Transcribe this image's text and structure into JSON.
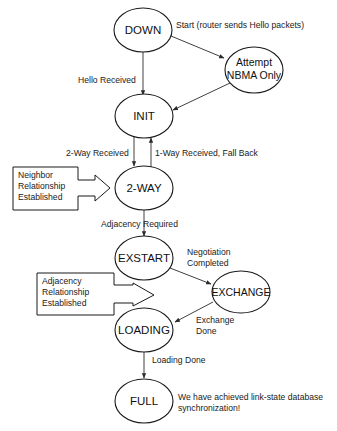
{
  "diagram": {
    "type": "state-machine",
    "topic": "OSPF neighbor states",
    "states": {
      "down": "DOWN",
      "attempt": [
        "Attempt",
        "NBMA Only"
      ],
      "init": "INIT",
      "twoway": "2-WAY",
      "exstart": "EXSTART",
      "exchange": "EXCHANGE",
      "loading": "LOADING",
      "full": "FULL"
    },
    "transitions": {
      "start": "Start (router sends Hello packets)",
      "hello_received": "Hello Received",
      "two_way_received": "2-Way Received",
      "one_way_fallback": "1-Way Received, Fall Back",
      "adjacency_required": "Adjacency Required",
      "negotiation_completed": [
        "Negotiation",
        "Completed"
      ],
      "exchange_done": [
        "Exchange",
        "Done"
      ],
      "loading_done": "Loading Done"
    },
    "callouts": {
      "neighbor": [
        "Neighbor",
        "Relationship",
        "Established"
      ],
      "adjacency": [
        "Adjacency",
        "Relationship",
        "Established"
      ]
    },
    "final_note": [
      "We have achieved link-state database",
      "synchronization!"
    ]
  }
}
